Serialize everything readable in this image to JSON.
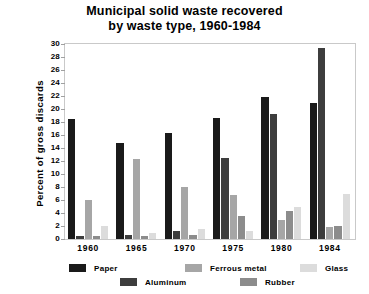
{
  "chart_data": {
    "type": "bar",
    "title": "Municipal solid waste recovered by waste type, 1960-1984",
    "title_lines": [
      "Municipal solid waste recovered",
      "by waste type, 1960-1984"
    ],
    "xlabel": "",
    "ylabel": "Percent of gross discards",
    "categories": [
      "1960",
      "1965",
      "1970",
      "1975",
      "1980",
      "1984"
    ],
    "ylim": [
      0,
      30
    ],
    "ytick_labels": [
      "0",
      "2",
      "4",
      "6",
      "8",
      "10",
      "12",
      "14",
      "16",
      "18",
      "20",
      "22",
      "24",
      "26",
      "28",
      "30"
    ],
    "ytick_values": [
      0,
      2,
      4,
      6,
      8,
      10,
      12,
      14,
      16,
      18,
      20,
      22,
      24,
      26,
      28,
      30
    ],
    "grid": false,
    "legend_position": "bottom",
    "series": [
      {
        "name": "Paper",
        "color": "#1a1a1a",
        "values": [
          18.5,
          14.8,
          16.3,
          18.6,
          21.8,
          21.0
        ]
      },
      {
        "name": "Aluminum",
        "color": "#3d3d3d",
        "values": [
          0.5,
          0.6,
          1.3,
          12.4,
          19.2,
          29.4
        ]
      },
      {
        "name": "Ferrous metal",
        "color": "#a6a6a6",
        "values": [
          6.0,
          12.3,
          8.0,
          6.7,
          2.9,
          1.8
        ]
      },
      {
        "name": "Rubber",
        "color": "#8c8c8c",
        "values": [
          0.4,
          0.5,
          0.6,
          3.5,
          4.3,
          2.0
        ]
      },
      {
        "name": "Glass",
        "color": "#dcdcdc",
        "values": [
          2.0,
          1.0,
          1.6,
          1.2,
          4.9,
          7.0
        ]
      }
    ]
  },
  "legend": {
    "row1": [
      "Paper",
      "Ferrous metal",
      "Glass"
    ],
    "row2": [
      "Aluminum",
      "Rubber"
    ]
  }
}
